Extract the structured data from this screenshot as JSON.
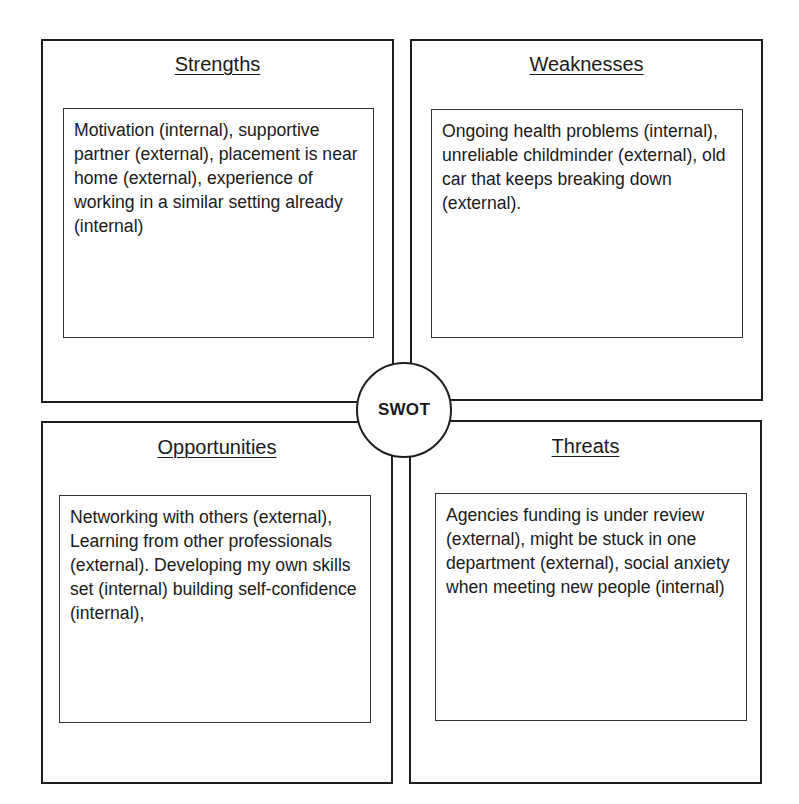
{
  "diagram": {
    "center_label": "SWOT",
    "quadrants": [
      {
        "id": "strengths",
        "title": "Strengths",
        "text": "Motivation (internal), supportive partner (external), placement is near home (external), experience of working in a similar setting already (internal)"
      },
      {
        "id": "weaknesses",
        "title": "Weaknesses",
        "text": "Ongoing health problems (internal), unreliable childminder (external), old car that keeps breaking down (external)."
      },
      {
        "id": "opportunities",
        "title": "Opportunities",
        "text": "Networking with others (external), Learning from other professionals (external). Developing my own skills set (internal) building self-confidence (internal),"
      },
      {
        "id": "threats",
        "title": "Threats",
        "text": "Agencies funding is under review (external), might be stuck in one department (external), social anxiety when meeting new people (internal)"
      }
    ],
    "colors": {
      "border": "#1e1e1e",
      "text": "#1a1a1a",
      "background": "#ffffff"
    }
  }
}
